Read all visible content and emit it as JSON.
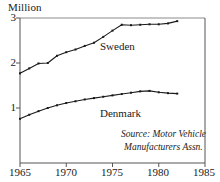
{
  "chart_data": {
    "type": "line",
    "title": "",
    "unit_label": "Million",
    "xlabel": "",
    "ylabel": "Million",
    "xlim": [
      1965,
      1985
    ],
    "ylim": [
      0,
      3
    ],
    "grid": false,
    "legend_position": "inline-labels",
    "xticks": [
      1965,
      1970,
      1975,
      1980,
      1985
    ],
    "yticks": [
      1,
      2,
      3
    ],
    "x": [
      1965,
      1966,
      1967,
      1968,
      1969,
      1970,
      1971,
      1972,
      1973,
      1974,
      1975,
      1976,
      1977,
      1978,
      1979,
      1980,
      1981,
      1982
    ],
    "series": [
      {
        "name": "Sweden",
        "color": "#1a1a1a",
        "values": [
          1.77,
          1.88,
          1.99,
          2.0,
          2.16,
          2.24,
          2.3,
          2.38,
          2.45,
          2.58,
          2.72,
          2.85,
          2.84,
          2.85,
          2.86,
          2.86,
          2.88,
          2.93
        ]
      },
      {
        "name": "Denmark",
        "color": "#1a1a1a",
        "values": [
          0.76,
          0.85,
          0.93,
          1.0,
          1.06,
          1.11,
          1.15,
          1.19,
          1.22,
          1.25,
          1.28,
          1.31,
          1.34,
          1.37,
          1.38,
          1.35,
          1.33,
          1.32
        ]
      }
    ],
    "annotations": [
      {
        "text": "Source: Motor Vehicle",
        "style": "italic"
      },
      {
        "text": "Manufacturers Assn.",
        "style": "italic"
      }
    ]
  },
  "axis": {
    "ytick_labels": [
      "3",
      "2",
      "1"
    ],
    "xtick_labels": [
      "1965",
      "1970",
      "1975",
      "1980",
      "1985"
    ]
  },
  "labels": {
    "sweden": "Sweden",
    "denmark": "Denmark"
  },
  "source": {
    "line1": "Source: Motor Vehicle",
    "line2": "Manufacturers Assn."
  },
  "colors": {
    "axis": "#555555",
    "line": "#1a1a1a",
    "text": "#1a1a1a",
    "background": "#ffffff"
  }
}
